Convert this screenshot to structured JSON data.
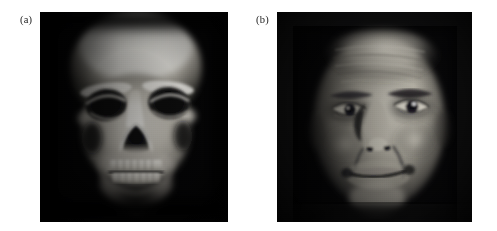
{
  "figure": {
    "background_color": "#ffffff",
    "panel_count": 2,
    "panels": [
      {
        "label": "(a)",
        "name": "skull-volume-rendering",
        "description": "Grayscale volume-rendered CT of a human skull, frontal view, bright bone on near-black background",
        "modality": "CT volume rendering",
        "subject": "human skull",
        "view": "anterior / frontal",
        "colormap": "grayscale",
        "background_color": "#050506",
        "bone_highlight_color": "#f2f0ea",
        "bone_midtone_color": "#b9b5ac",
        "shadow_color": "#101014",
        "x": 40,
        "y": 12,
        "width": 188,
        "height": 210,
        "label_x": 20,
        "label_y": 15
      },
      {
        "label": "(b)",
        "name": "face-photograph",
        "description": "Grayscale photographic portrait of an elderly man, frontal view, strong directional side lighting on dark background",
        "modality": "photograph",
        "subject": "elderly male face",
        "view": "anterior / frontal",
        "colormap": "grayscale",
        "background_color": "#08080a",
        "skin_highlight_color": "#e8e4dc",
        "skin_midtone_color": "#9b968d",
        "shadow_color": "#121215",
        "x": 277,
        "y": 12,
        "width": 195,
        "height": 210,
        "label_x": 256,
        "label_y": 15
      }
    ]
  }
}
